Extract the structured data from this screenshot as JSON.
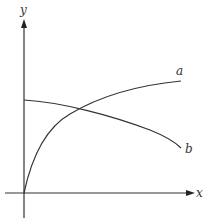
{
  "diagram": {
    "type": "function-graph",
    "axes": {
      "x_label": "x",
      "y_label": "y"
    },
    "curves": [
      {
        "label": "a",
        "description": "increasing, concave down, starts at origin"
      },
      {
        "label": "b",
        "description": "decreasing, starts at positive y-intercept"
      }
    ],
    "colors": {
      "line": "#333333",
      "background": "#ffffff"
    }
  }
}
